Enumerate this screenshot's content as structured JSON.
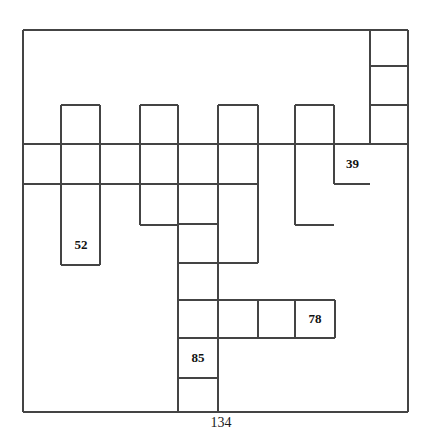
{
  "figure": {
    "title": "",
    "type": "grid-polyomino-diagram",
    "stroke_color": "#444444",
    "background_color": "#ffffff",
    "text_color": "#111111",
    "grid_step_px": 39.5,
    "outer_rect": {
      "x": 23,
      "y": 30,
      "width": 385,
      "height": 382
    },
    "labels": [
      {
        "name": "label-52",
        "text": "52",
        "cell_x": 61,
        "cell_y": 225,
        "cell_w": 40,
        "cell_h": 40
      },
      {
        "name": "label-39",
        "text": "39",
        "cell_x": 334,
        "cell_y": 144,
        "cell_w": 37,
        "cell_h": 40
      },
      {
        "name": "label-78",
        "text": "78",
        "cell_x": 295,
        "cell_y": 300,
        "cell_w": 40,
        "cell_h": 38
      },
      {
        "name": "label-85",
        "text": "85",
        "cell_x": 178,
        "cell_y": 338,
        "cell_w": 40,
        "cell_h": 40
      }
    ],
    "axis_label": {
      "name": "bottom-label-134",
      "text": "134",
      "x": 200,
      "y": 415,
      "width": 42
    },
    "segments": {
      "description": "All line segments composing the diagram, in px: x1,y1,x2,y2",
      "lines": [
        [
          23,
          30,
          370,
          30
        ],
        [
          370,
          30,
          408,
          30
        ],
        [
          23,
          30,
          23,
          412
        ],
        [
          408,
          30,
          408,
          412
        ],
        [
          23,
          412,
          178,
          412
        ],
        [
          178,
          412,
          218,
          412
        ],
        [
          218,
          412,
          408,
          412
        ],
        [
          370,
          66,
          408,
          66
        ],
        [
          370,
          105,
          408,
          105
        ],
        [
          370,
          30,
          370,
          144
        ],
        [
          23,
          144,
          295,
          144
        ],
        [
          295,
          144,
          334,
          144
        ],
        [
          334,
          144,
          370,
          144
        ],
        [
          370,
          144,
          408,
          144
        ],
        [
          23,
          184,
          140,
          184
        ],
        [
          140,
          184,
          178,
          184
        ],
        [
          178,
          184,
          218,
          184
        ],
        [
          218,
          184,
          258,
          184
        ],
        [
          61,
          105,
          100,
          105
        ],
        [
          61,
          105,
          61,
          265
        ],
        [
          100,
          105,
          100,
          265
        ],
        [
          61,
          265,
          100,
          265
        ],
        [
          140,
          105,
          178,
          105
        ],
        [
          140,
          105,
          140,
          225
        ],
        [
          178,
          105,
          178,
          225
        ],
        [
          140,
          225,
          178,
          225
        ],
        [
          218,
          105,
          258,
          105
        ],
        [
          218,
          105,
          218,
          412
        ],
        [
          258,
          105,
          258,
          263
        ],
        [
          178,
          263,
          258,
          263
        ],
        [
          178,
          224,
          178,
          412
        ],
        [
          178,
          224,
          218,
          224
        ],
        [
          295,
          105,
          334,
          105
        ],
        [
          295,
          105,
          295,
          225
        ],
        [
          334,
          105,
          334,
          184
        ],
        [
          295,
          225,
          334,
          225
        ],
        [
          334,
          184,
          370,
          184
        ],
        [
          178,
          300,
          335,
          300
        ],
        [
          178,
          338,
          335,
          338
        ],
        [
          258,
          300,
          258,
          338
        ],
        [
          295,
          300,
          295,
          338
        ],
        [
          335,
          300,
          335,
          338
        ],
        [
          178,
          378,
          218,
          378
        ]
      ]
    }
  }
}
